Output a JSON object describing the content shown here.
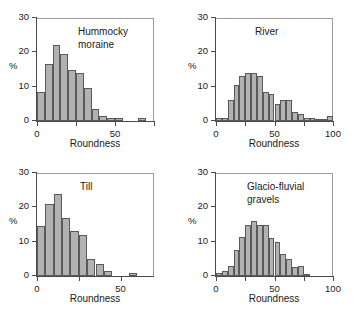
{
  "figure": {
    "ylabel": "%",
    "xlabel": "Roundness",
    "bar_color": "#b2b2b2",
    "bar_edge_color": "#5a5a5a",
    "axis_color": "#4a4a4a"
  },
  "chart_data": [
    {
      "type": "bar",
      "title": "Hummocky\nmoraine",
      "xlabel": "Roundness",
      "ylabel": "%",
      "xlim": [
        0,
        75
      ],
      "ylim": [
        0,
        30
      ],
      "ytick_values": [
        0,
        10,
        20,
        30
      ],
      "ytick_labels": [
        "0",
        "10",
        "20",
        "30"
      ],
      "xtick_values": [
        0,
        25,
        50,
        75
      ],
      "xtick_labels": [
        "0",
        "",
        "50",
        ""
      ],
      "grid": false,
      "legend": "none",
      "bin_width": 5,
      "bin_starts": [
        0,
        5,
        10,
        15,
        20,
        25,
        30,
        35,
        40,
        45,
        50,
        55,
        60,
        65,
        70
      ],
      "values": [
        8.5,
        16.5,
        22,
        19.5,
        15,
        14,
        9.5,
        3.5,
        1.5,
        1,
        1,
        0,
        0,
        1,
        0
      ]
    },
    {
      "type": "bar",
      "title": "River",
      "xlabel": "Roundness",
      "ylabel": "%",
      "xlim": [
        0,
        100
      ],
      "ylim": [
        0,
        30
      ],
      "ytick_values": [
        0,
        10,
        20,
        30
      ],
      "ytick_labels": [
        "0",
        "10",
        "20",
        "30"
      ],
      "xtick_values": [
        0,
        25,
        50,
        75,
        100
      ],
      "xtick_labels": [
        "0",
        "",
        "50",
        "",
        "100"
      ],
      "grid": false,
      "legend": "none",
      "bin_width": 5,
      "bin_starts": [
        0,
        5,
        10,
        15,
        20,
        25,
        30,
        35,
        40,
        45,
        50,
        55,
        60,
        65,
        70,
        75,
        80,
        85,
        90,
        95
      ],
      "values": [
        1,
        1,
        6,
        10.5,
        13,
        14,
        14,
        13,
        8.5,
        8,
        5,
        6,
        6,
        2.5,
        2,
        1,
        1,
        0.5,
        0.5,
        1.5
      ]
    },
    {
      "type": "bar",
      "title": "Till",
      "xlabel": "Roundness",
      "ylabel": "%",
      "xlim": [
        0,
        70
      ],
      "ylim": [
        0,
        30
      ],
      "ytick_values": [
        0,
        10,
        20,
        30
      ],
      "ytick_labels": [
        "0",
        "10",
        "20",
        "30"
      ],
      "xtick_values": [
        0,
        25,
        50
      ],
      "xtick_labels": [
        "0",
        "",
        "50"
      ],
      "grid": false,
      "legend": "none",
      "bin_width": 5,
      "bin_starts": [
        0,
        5,
        10,
        15,
        20,
        25,
        30,
        35,
        40,
        45,
        50,
        55,
        60,
        65
      ],
      "values": [
        14.5,
        21,
        24,
        17,
        13,
        12,
        5,
        3.5,
        1.5,
        0,
        0,
        1,
        0,
        0
      ]
    },
    {
      "type": "bar",
      "title": "Glacio-fluvial\ngravels",
      "xlabel": "Roundness",
      "ylabel": "%",
      "xlim": [
        0,
        100
      ],
      "ylim": [
        0,
        30
      ],
      "ytick_values": [
        0,
        10,
        20,
        30
      ],
      "ytick_labels": [
        "0",
        "10",
        "20",
        "30"
      ],
      "xtick_values": [
        0,
        25,
        50,
        75,
        100
      ],
      "xtick_labels": [
        "0",
        "",
        "50",
        "",
        "100"
      ],
      "grid": false,
      "legend": "none",
      "bin_width": 5,
      "bin_starts": [
        0,
        5,
        10,
        15,
        20,
        25,
        30,
        35,
        40,
        45,
        50,
        55,
        60,
        65,
        70,
        75,
        80,
        85,
        90,
        95
      ],
      "values": [
        1,
        1.5,
        3,
        7.5,
        11.5,
        15,
        16,
        15,
        15,
        11,
        10,
        6.5,
        5,
        2.5,
        3,
        0.5,
        0,
        0,
        0,
        0
      ]
    }
  ]
}
